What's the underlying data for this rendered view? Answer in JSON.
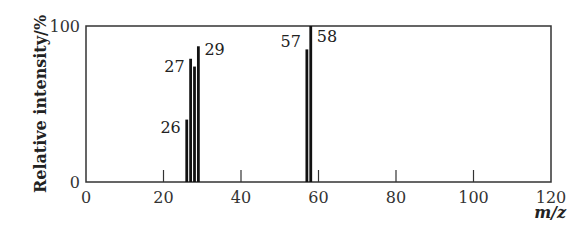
{
  "chart_data": {
    "type": "bar",
    "title": "",
    "xlabel": "m/z",
    "ylabel": "Relative intensity/%",
    "xlim": [
      0,
      120
    ],
    "ylim": [
      0,
      100
    ],
    "x_ticks": [
      0,
      20,
      40,
      60,
      80,
      100,
      120
    ],
    "y_ticks": [
      0,
      100
    ],
    "grid": false,
    "legend": null,
    "x": [
      26,
      27,
      28,
      29,
      57,
      58
    ],
    "values": [
      40,
      79,
      74,
      87,
      85,
      100
    ],
    "annotations": [
      {
        "x": 26,
        "label": "26"
      },
      {
        "x": 27,
        "label": "27"
      },
      {
        "x": 29,
        "label": "29"
      },
      {
        "x": 57,
        "label": "57"
      },
      {
        "x": 58,
        "label": "58"
      }
    ]
  },
  "colors": {
    "bar": "#111111",
    "axis": "#333333"
  }
}
